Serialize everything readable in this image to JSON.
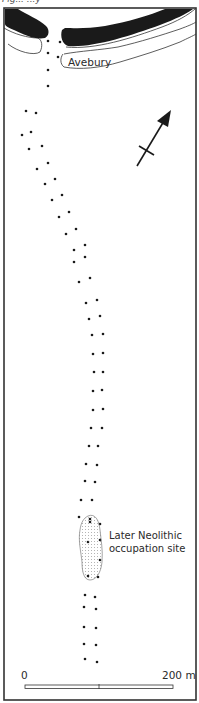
{
  "map": {
    "title": "Avebury",
    "caption_fragment": "Fig... ...y",
    "site_label_line1": "Later Neolithic",
    "site_label_line2": "occupation site",
    "scale": {
      "start_label": "0",
      "end_label": "200 m",
      "bar_x_start": 25,
      "bar_x_end": 173,
      "bar_y": 686
    },
    "north_arrow": {
      "icon": "north-arrow-icon",
      "direction": "north-east"
    },
    "frame": {
      "left": 4,
      "top": 8,
      "right": 196,
      "bottom": 700
    },
    "colors": {
      "bank": "#1a1a1a",
      "ink": "#2a2a2a",
      "stipple": "#555555",
      "background": "#ffffff"
    },
    "avenue_stones": [
      [
        48,
        41
      ],
      [
        60,
        42
      ],
      [
        48,
        53
      ],
      [
        58,
        57
      ],
      [
        48,
        70
      ],
      [
        48,
        86
      ],
      [
        26,
        111
      ],
      [
        36,
        113
      ],
      [
        22,
        135
      ],
      [
        31,
        132
      ],
      [
        29,
        149
      ],
      [
        42,
        146
      ],
      [
        37,
        169
      ],
      [
        48,
        163
      ],
      [
        45,
        184
      ],
      [
        55,
        179
      ],
      [
        52,
        200
      ],
      [
        62,
        195
      ],
      [
        59,
        217
      ],
      [
        69,
        212
      ],
      [
        66,
        234
      ],
      [
        76,
        229
      ],
      [
        74,
        250
      ],
      [
        85,
        245
      ],
      [
        74,
        262
      ],
      [
        85,
        257
      ],
      [
        79,
        282
      ],
      [
        90,
        278
      ],
      [
        86,
        303
      ],
      [
        97,
        300
      ],
      [
        89,
        319
      ],
      [
        100,
        316
      ],
      [
        92,
        335
      ],
      [
        103,
        334
      ],
      [
        93,
        354
      ],
      [
        103,
        353
      ],
      [
        94,
        372
      ],
      [
        103,
        372
      ],
      [
        93,
        391
      ],
      [
        102,
        390
      ],
      [
        93,
        410
      ],
      [
        103,
        409
      ],
      [
        91,
        428
      ],
      [
        102,
        428
      ],
      [
        89,
        446
      ],
      [
        98,
        446
      ],
      [
        86,
        464
      ],
      [
        97,
        465
      ],
      [
        85,
        481
      ],
      [
        95,
        482
      ],
      [
        81,
        500
      ],
      [
        92,
        500
      ],
      [
        79,
        517
      ],
      [
        90,
        519
      ],
      [
        90,
        522
      ],
      [
        100,
        524
      ],
      [
        88,
        542
      ],
      [
        100,
        540
      ],
      [
        100,
        560
      ],
      [
        88,
        576
      ],
      [
        98,
        577
      ],
      [
        85,
        595
      ],
      [
        95,
        597
      ],
      [
        84,
        607
      ],
      [
        96,
        609
      ],
      [
        84,
        627
      ],
      [
        96,
        628
      ],
      [
        84,
        644
      ],
      [
        96,
        645
      ],
      [
        85,
        659
      ],
      [
        97,
        662
      ]
    ],
    "occupation_site": {
      "outline": "M88,516 C95,513 99,520 100,530 C101,540 103,550 102,562 C101,573 96,580 90,580 C84,580 82,572 82,562 C81,552 78,540 80,530 C81,522 84,518 88,516 Z"
    }
  }
}
